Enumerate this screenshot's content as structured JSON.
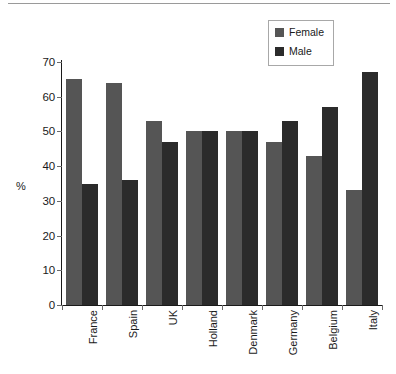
{
  "chart_data": {
    "type": "bar",
    "title": "",
    "subtitle": "",
    "xlabel": "",
    "ylabel": "%",
    "ylim": [
      0,
      70
    ],
    "ytick_step": 10,
    "yticks": [
      0,
      10,
      20,
      30,
      40,
      50,
      60,
      70
    ],
    "grid": false,
    "legend_position": "top-right",
    "categories": [
      "France",
      "Spain",
      "UK",
      "Holland",
      "Denmark",
      "Germany",
      "Belgium",
      "Italy"
    ],
    "series": [
      {
        "name": "Female",
        "color": "#555555",
        "values": [
          65,
          64,
          53,
          50,
          50,
          47,
          43,
          33
        ]
      },
      {
        "name": "Male",
        "color": "#2b2b2b",
        "values": [
          35,
          36,
          47,
          50,
          50,
          53,
          57,
          67
        ]
      }
    ]
  },
  "legend": {
    "items": [
      {
        "label": "Female",
        "color": "#555555"
      },
      {
        "label": "Male",
        "color": "#2b2b2b"
      }
    ]
  },
  "axes": {
    "y_title": "%"
  }
}
